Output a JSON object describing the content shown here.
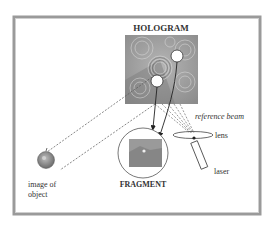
{
  "diagram": {
    "title": "HOLOGRAM",
    "labels": {
      "hologram": "HOLOGRAM",
      "fragment": "FRAGMENT",
      "reference_beam": "reference beam",
      "lens": "lens",
      "laser": "laser",
      "image_of_object_line1": "image of",
      "image_of_object_line2": "object"
    },
    "colors": {
      "frame": "#8a8a8a",
      "line": "#444444",
      "hologram_fill": "#9a9a9a",
      "text": "#333333"
    }
  }
}
